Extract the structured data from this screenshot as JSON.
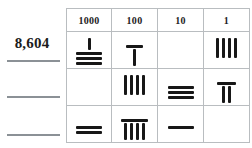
{
  "worksheet": {
    "title": "Place Value Tally Chart",
    "answer_column_label": "",
    "table": {
      "headers": [
        "1000",
        "100",
        "10",
        "1"
      ],
      "rows": [
        {
          "answer": "8,604",
          "answer_filled": true,
          "cells": [
            {
              "place": "1000",
              "arrangement": "strokes-over-bars",
              "strokes": 1,
              "bars": 3,
              "value": 8
            },
            {
              "place": "100",
              "arrangement": "bar-over-strokes",
              "strokes": 1,
              "bars": 1,
              "value": 6
            },
            {
              "place": "10",
              "arrangement": "empty",
              "strokes": 0,
              "bars": 0,
              "value": 0
            },
            {
              "place": "1",
              "arrangement": "strokes-only",
              "strokes": 4,
              "bars": 0,
              "value": 4
            }
          ]
        },
        {
          "answer": "",
          "answer_filled": false,
          "cells": [
            {
              "place": "1000",
              "arrangement": "empty",
              "strokes": 0,
              "bars": 0,
              "value": 0
            },
            {
              "place": "100",
              "arrangement": "strokes-only",
              "strokes": 4,
              "bars": 0,
              "value": 4
            },
            {
              "place": "10",
              "arrangement": "bars-only",
              "strokes": 0,
              "bars": 3,
              "value": 3
            },
            {
              "place": "1",
              "arrangement": "bar-over-strokes",
              "strokes": 2,
              "bars": 1,
              "value": 7
            }
          ]
        },
        {
          "answer": "",
          "answer_filled": false,
          "cells": [
            {
              "place": "1000",
              "arrangement": "bars-only",
              "strokes": 0,
              "bars": 2,
              "value": 2
            },
            {
              "place": "100",
              "arrangement": "bar-over-strokes",
              "strokes": 4,
              "bars": 1,
              "value": 9
            },
            {
              "place": "10",
              "arrangement": "bars-only",
              "strokes": 0,
              "bars": 1,
              "value": 1
            },
            {
              "place": "1",
              "arrangement": "empty",
              "strokes": 0,
              "bars": 0,
              "value": 0
            }
          ]
        }
      ]
    },
    "colors": {
      "ink": "#171717",
      "grid": "#b9bdc0",
      "rule": "#8b9196",
      "background": "#ffffff"
    }
  }
}
